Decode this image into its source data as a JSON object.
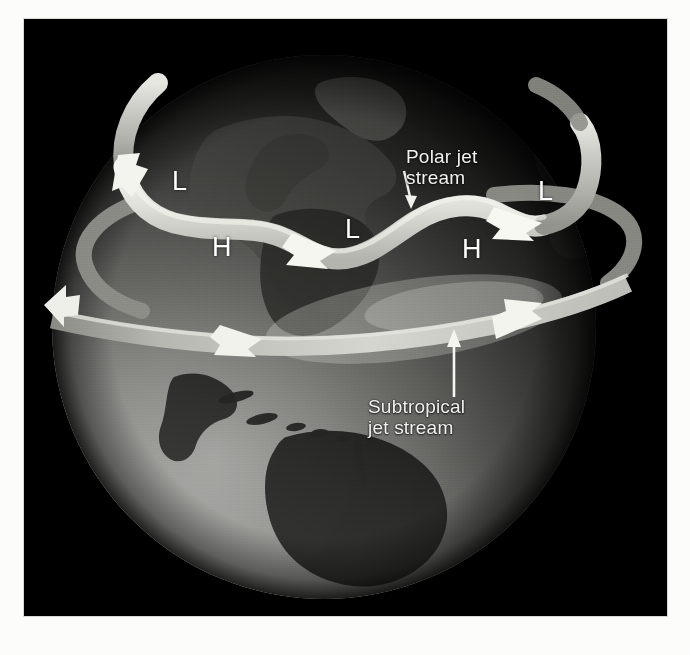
{
  "figure": {
    "background_color": "#000000",
    "paper_color": "#fcfcfa",
    "band_color": "#b9b9b4",
    "band_highlight_color": "#f0f0ec",
    "label_color": "#f2f2f0",
    "globe_day_color": "#8e8e8a",
    "globe_night_color": "#1d1d1d"
  },
  "callouts": [
    {
      "id": "polar-jet",
      "line1": "Polar jet",
      "line2": "stream",
      "x": 406,
      "y": 147,
      "arrow": "down-right"
    },
    {
      "id": "subtropical-jet",
      "line1": "Subtropical",
      "line2": "jet stream",
      "x": 368,
      "y": 397,
      "arrow": "up"
    }
  ],
  "pressure_labels": [
    {
      "id": "low-left",
      "text": "L",
      "x": 172,
      "y": 168
    },
    {
      "id": "high-left",
      "text": "H",
      "x": 212,
      "y": 234
    },
    {
      "id": "low-center",
      "text": "L",
      "x": 345,
      "y": 215
    },
    {
      "id": "high-right",
      "text": "H",
      "x": 462,
      "y": 237
    },
    {
      "id": "low-right",
      "text": "L",
      "x": 538,
      "y": 178
    }
  ],
  "jet_streams": [
    {
      "id": "polar-jet-stream",
      "name": "Polar jet stream",
      "description": "Meandering wavy band across high northern latitudes with westerly flow",
      "flow_direction": "west-to-east",
      "arrowheads": 3
    },
    {
      "id": "subtropical-jet-stream",
      "name": "Subtropical jet stream",
      "description": "Broad band encircling the globe at lower latitude",
      "flow_direction": "west-to-east",
      "arrowheads": 3
    }
  ]
}
